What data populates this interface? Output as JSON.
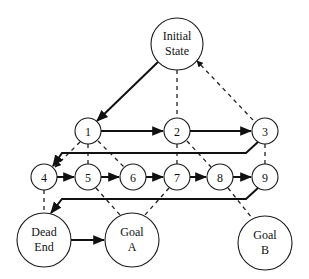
{
  "diagram": {
    "type": "state-space search graph",
    "nodes": [
      {
        "id": "initial",
        "lines": [
          "Initial",
          "State"
        ],
        "x": 177,
        "y": 44,
        "r": 26
      },
      {
        "id": "1",
        "lines": [
          "1"
        ],
        "x": 88,
        "y": 131,
        "r": 13
      },
      {
        "id": "2",
        "lines": [
          "2"
        ],
        "x": 177,
        "y": 131,
        "r": 13
      },
      {
        "id": "3",
        "lines": [
          "3"
        ],
        "x": 265,
        "y": 131,
        "r": 13
      },
      {
        "id": "4",
        "lines": [
          "4"
        ],
        "x": 44,
        "y": 177,
        "r": 13
      },
      {
        "id": "5",
        "lines": [
          "5"
        ],
        "x": 88,
        "y": 177,
        "r": 13
      },
      {
        "id": "6",
        "lines": [
          "6"
        ],
        "x": 133,
        "y": 177,
        "r": 13
      },
      {
        "id": "7",
        "lines": [
          "7"
        ],
        "x": 177,
        "y": 177,
        "r": 13
      },
      {
        "id": "8",
        "lines": [
          "8"
        ],
        "x": 220,
        "y": 177,
        "r": 13
      },
      {
        "id": "9",
        "lines": [
          "9"
        ],
        "x": 265,
        "y": 177,
        "r": 13
      },
      {
        "id": "dead-end",
        "lines": [
          "Dead",
          "End"
        ],
        "x": 44,
        "y": 240,
        "r": 27
      },
      {
        "id": "goal-a",
        "lines": [
          "Goal",
          "A"
        ],
        "x": 132,
        "y": 240,
        "r": 27
      },
      {
        "id": "goal-b",
        "lines": [
          "Goal",
          "B"
        ],
        "x": 265,
        "y": 243,
        "r": 27
      }
    ],
    "solid_edges": [
      [
        "initial",
        "1"
      ],
      [
        "1",
        "2"
      ],
      [
        "2",
        "3"
      ],
      [
        "3",
        "4"
      ],
      [
        "4",
        "5"
      ],
      [
        "5",
        "6"
      ],
      [
        "6",
        "7"
      ],
      [
        "7",
        "8"
      ],
      [
        "8",
        "9"
      ],
      [
        "9",
        "dead-end"
      ],
      [
        "dead-end",
        "goal-a"
      ]
    ],
    "dashed_edges": [
      [
        "initial",
        "2"
      ],
      [
        "initial",
        "3"
      ],
      [
        "1",
        "4"
      ],
      [
        "1",
        "5"
      ],
      [
        "1",
        "6"
      ],
      [
        "2",
        "7"
      ],
      [
        "2",
        "8"
      ],
      [
        "3",
        "9"
      ],
      [
        "4",
        "dead-end"
      ],
      [
        "5",
        "goal-a"
      ],
      [
        "7",
        "goal-a"
      ],
      [
        "8",
        "goal-b"
      ]
    ],
    "colors": {
      "stroke": "#111111",
      "background": "#ffffff"
    }
  }
}
